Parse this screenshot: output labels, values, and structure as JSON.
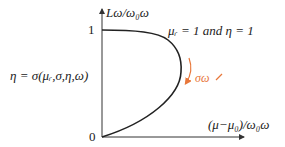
{
  "diagram": {
    "y_axis_label": "Lω/ω₀ω",
    "x_axis_label": "(μ−μ₀)/ω₀ω",
    "tick_y_one": "1",
    "tick_origin": "0",
    "condition_label": "μᵣ = 1  and  η = 1",
    "eta_definition": "η = σ(μᵣ,σ,η,ω)",
    "trend_label": "σω ↗",
    "colors": {
      "curve": "#222222",
      "axes": "#333333",
      "trend_arrow": "#e8773a"
    }
  }
}
